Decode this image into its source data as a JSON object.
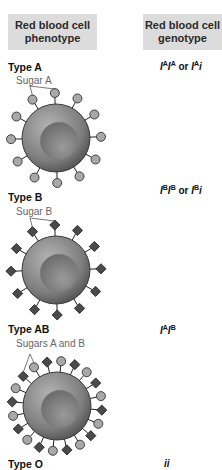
{
  "headers": {
    "phenotype": "Red blood cell phenotype",
    "genotype": "Red blood cell genotype"
  },
  "colors": {
    "header_bg": "#dcdcdc",
    "cell_fill": "#8a8a8a",
    "sugar_a_fill": "#a8a8a8",
    "sugar_b_fill": "#4a4a4a"
  },
  "rows": [
    {
      "type": "Type A",
      "sugar_label": "Sugar A",
      "genotype": [
        [
          "I",
          "A"
        ],
        [
          "I",
          "A"
        ],
        [
          " or ",
          ""
        ],
        [
          "I",
          "A"
        ],
        [
          "i",
          ""
        ]
      ],
      "genotype_text": "IAIA or IAi",
      "sugars": "A"
    },
    {
      "type": "Type B",
      "sugar_label": "Sugar B",
      "genotype": [
        [
          "I",
          "B"
        ],
        [
          "I",
          "B"
        ],
        [
          " or ",
          ""
        ],
        [
          "I",
          "B"
        ],
        [
          "i",
          ""
        ]
      ],
      "genotype_text": "IBIB or IBi",
      "sugars": "B"
    },
    {
      "type": "Type AB",
      "sugar_label": "Sugars A and B",
      "genotype": [
        [
          "I",
          "A"
        ],
        [
          "I",
          "B"
        ]
      ],
      "genotype_text": "IAIB",
      "sugars": "AB"
    },
    {
      "type": "Type O",
      "sugar_label": "",
      "genotype": [
        [
          "ii",
          ""
        ]
      ],
      "genotype_text": "ii",
      "sugars": ""
    }
  ]
}
